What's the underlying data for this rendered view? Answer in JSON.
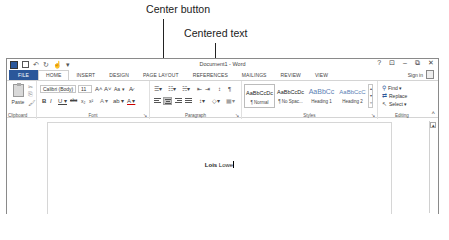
{
  "callouts": {
    "center_button": "Center button",
    "centered_text": "Centered text"
  },
  "window": {
    "title": "Document1 - Word",
    "controls": {
      "help": "?",
      "ribbon_display": "⊡",
      "minimize": "–",
      "restore": "⧉",
      "close": "✕"
    },
    "sign_in": "Sign in"
  },
  "qat": {
    "undo": "↶",
    "undo_dropdown": "·",
    "redo": "↻",
    "touch": "☝",
    "customize": "▾"
  },
  "tabs": [
    {
      "label": "FILE"
    },
    {
      "label": "HOME"
    },
    {
      "label": "INSERT"
    },
    {
      "label": "DESIGN"
    },
    {
      "label": "PAGE LAYOUT"
    },
    {
      "label": "REFERENCES"
    },
    {
      "label": "MAILINGS"
    },
    {
      "label": "REVIEW"
    },
    {
      "label": "VIEW"
    }
  ],
  "ribbon": {
    "clipboard": {
      "label": "Clipboard",
      "paste": "Paste",
      "paste_arrow": "▾",
      "cut": "✂",
      "copy": "⎘",
      "format_painter": "🖌"
    },
    "font": {
      "label": "Font",
      "font_name": "Calibri (Body)",
      "font_size": "11",
      "grow": "A˄",
      "shrink": "A˅",
      "change_case": "Aa ▾",
      "clear": "A̷",
      "bold": "B",
      "italic": "I",
      "underline": "U ▾",
      "strike": "abc",
      "subscript": "x₂",
      "superscript": "x²",
      "text_effects": "A ▾",
      "highlight": "ab ▾",
      "font_color": "A ▾"
    },
    "paragraph": {
      "label": "Paragraph",
      "bullets": "☰▾",
      "numbering": "☷▾",
      "multilevel": "☵▾",
      "decrease_indent": "⇤",
      "increase_indent": "⇥",
      "sort": "↕",
      "show_marks": "¶",
      "line_spacing": "↕▾",
      "shading": "◇▾",
      "borders": "▦▾"
    },
    "styles": {
      "label": "Styles",
      "items": [
        {
          "sample": "AaBbCcDc",
          "name": "¶ Normal",
          "heading": false,
          "selected": true
        },
        {
          "sample": "AaBbCcDc",
          "name": "¶ No Spac...",
          "heading": false,
          "selected": false
        },
        {
          "sample": "AaBbCc",
          "name": "Heading 1",
          "heading": true,
          "selected": false
        },
        {
          "sample": "AaBbCcC",
          "name": "Heading 2",
          "heading": true,
          "selected": false
        }
      ]
    },
    "editing": {
      "label": "Editing",
      "find": "Find ▾",
      "replace": "Replace",
      "select": "Select ▾"
    },
    "launcher": "↘",
    "collapse": "˄"
  },
  "document": {
    "text_bold": "Lois",
    "text_normal": " Lowe"
  },
  "colors": {
    "file_tab": "#2b579a",
    "accent": "#2b579a"
  }
}
